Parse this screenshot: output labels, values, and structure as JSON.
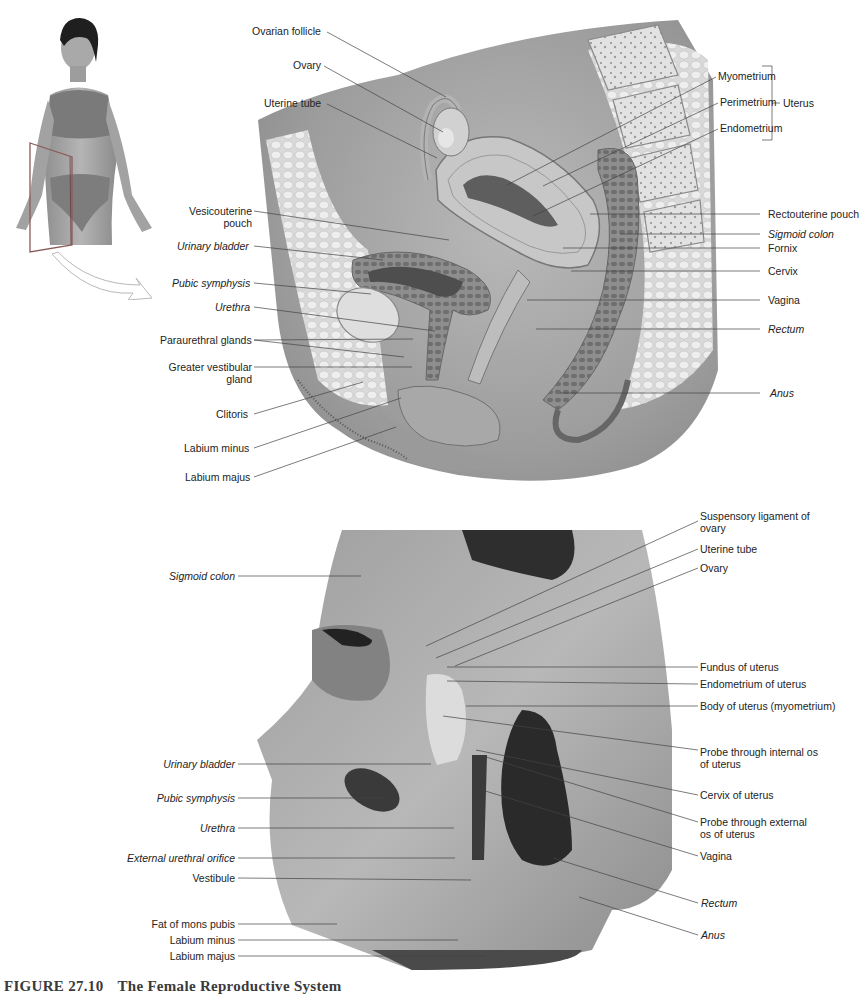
{
  "figure": {
    "number": "FIGURE 27.10",
    "title": "The Female Reproductive System"
  },
  "thumbnail": {
    "description": "Photo of standing woman with sagittal section plane indicator and arrow pointing to illustration",
    "plane_color": "#8a6a6a"
  },
  "illustration": {
    "view": "Sagittal section illustration",
    "labels_top": [
      {
        "text": "Ovarian follicle",
        "italic": false
      },
      {
        "text": "Ovary",
        "italic": false
      },
      {
        "text": "Uterine tube",
        "italic": false
      }
    ],
    "labels_left": [
      {
        "text": "Vesicouterine pouch",
        "italic": false
      },
      {
        "text": "Urinary bladder",
        "italic": true
      },
      {
        "text": "Pubic symphysis",
        "italic": true
      },
      {
        "text": "Urethra",
        "italic": true
      },
      {
        "text": "Paraurethral glands",
        "italic": false
      },
      {
        "text": "Greater vestibular gland",
        "italic": false
      },
      {
        "text": "Clitoris",
        "italic": false
      },
      {
        "text": "Labium minus",
        "italic": false
      },
      {
        "text": "Labium majus",
        "italic": false
      }
    ],
    "labels_right": [
      {
        "text": "Myometrium",
        "italic": false
      },
      {
        "text": "Perimetrium",
        "italic": false
      },
      {
        "text": "Endometrium",
        "italic": false
      },
      {
        "text": "Rectouterine pouch",
        "italic": false
      },
      {
        "text": "Sigmoid colon",
        "italic": true
      },
      {
        "text": "Fornix",
        "italic": false
      },
      {
        "text": "Cervix",
        "italic": false
      },
      {
        "text": "Vagina",
        "italic": false
      },
      {
        "text": "Rectum",
        "italic": true
      },
      {
        "text": "Anus",
        "italic": true
      }
    ],
    "bracket_label": "Uterus"
  },
  "photo": {
    "view": "Sagittal section cadaver dissection",
    "labels_left": [
      {
        "text": "Sigmoid colon",
        "italic": true
      },
      {
        "text": "Urinary bladder",
        "italic": true
      },
      {
        "text": "Pubic symphysis",
        "italic": true
      },
      {
        "text": "Urethra",
        "italic": true
      },
      {
        "text": "External urethral orifice",
        "italic": true
      },
      {
        "text": "Vestibule",
        "italic": false
      },
      {
        "text": "Fat of mons pubis",
        "italic": false
      },
      {
        "text": "Labium minus",
        "italic": false
      },
      {
        "text": "Labium majus",
        "italic": false
      }
    ],
    "labels_right": [
      {
        "text": "Suspensory ligament of ovary",
        "italic": false
      },
      {
        "text": "Uterine tube",
        "italic": false
      },
      {
        "text": "Ovary",
        "italic": false
      },
      {
        "text": "Fundus of uterus",
        "italic": false
      },
      {
        "text": "Endometrium of uterus",
        "italic": false
      },
      {
        "text": "Body of uterus (myometrium)",
        "italic": false
      },
      {
        "text": "Probe through internal os of uterus",
        "italic": false
      },
      {
        "text": "Cervix of uterus",
        "italic": false
      },
      {
        "text": "Probe through external os of uterus",
        "italic": false
      },
      {
        "text": "Vagina",
        "italic": false
      },
      {
        "text": "Rectum",
        "italic": true
      },
      {
        "text": "Anus",
        "italic": true
      }
    ]
  }
}
